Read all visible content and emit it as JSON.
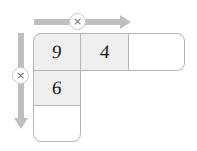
{
  "puzzle": {
    "type": "multiplication-grid",
    "shape": "L-shape",
    "arrows": {
      "top": {
        "direction": "right",
        "operator_icon": "multiply-icon",
        "operator_symbol": "×"
      },
      "left": {
        "direction": "down",
        "operator_icon": "multiply-icon",
        "operator_symbol": "×"
      }
    },
    "colors": {
      "arrow": "#bfbfbf",
      "cell_border": "#b5b5b5",
      "cell_filled": "#efefef",
      "cell_empty": "#ffffff",
      "badge_border": "#c9c9c9",
      "text": "#1a1a1a"
    },
    "cells": {
      "top_row": [
        {
          "value": "9",
          "state": "filled"
        },
        {
          "value": "4",
          "state": "filled"
        },
        {
          "value": "",
          "state": "empty"
        }
      ],
      "left_column_rest": [
        {
          "value": "6",
          "state": "filled"
        },
        {
          "value": "",
          "state": "empty"
        }
      ]
    }
  }
}
